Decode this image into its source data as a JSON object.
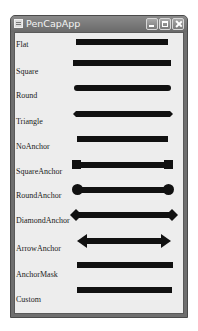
{
  "window": {
    "title": "PenCapApp",
    "controls": {
      "minimize": "minimize",
      "maximize": "maximize",
      "close": "close"
    }
  },
  "rows": [
    {
      "label": "Flat",
      "cap": "flat"
    },
    {
      "label": "Square",
      "cap": "square"
    },
    {
      "label": "Round",
      "cap": "round"
    },
    {
      "label": "Triangle",
      "cap": "triangle"
    },
    {
      "label": "NoAnchor",
      "cap": "noanchor"
    },
    {
      "label": "SquareAnchor",
      "cap": "squareanchor"
    },
    {
      "label": "RoundAnchor",
      "cap": "roundanchor"
    },
    {
      "label": "DiamondAnchor",
      "cap": "diamondanchor"
    },
    {
      "label": "ArrowAnchor",
      "cap": "arrowanchor"
    },
    {
      "label": "AnchorMask",
      "cap": "anchormask"
    },
    {
      "label": "Custom",
      "cap": "custom"
    }
  ],
  "colors": {
    "line": "#111111",
    "background": "#ededed",
    "titlebar": "#7a7a7a"
  }
}
